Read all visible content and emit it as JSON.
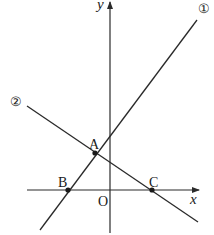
{
  "diagram": {
    "axes": {
      "x_label": "x",
      "y_label": "y",
      "origin_label": "O"
    },
    "lines": [
      {
        "id": "line-1",
        "label": "①",
        "passes_through": [
          "A",
          "B"
        ],
        "slope_sign": "positive"
      },
      {
        "id": "line-2",
        "label": "②",
        "passes_through": [
          "A",
          "C"
        ],
        "slope_sign": "negative"
      }
    ],
    "points": [
      {
        "name": "A",
        "description": "intersection of line ① and line ②"
      },
      {
        "name": "B",
        "description": "intersection of line ① and x-axis"
      },
      {
        "name": "C",
        "description": "intersection of line ② and x-axis"
      }
    ],
    "colors": {
      "stroke": "#2a2a2a",
      "background": "#ffffff"
    }
  }
}
